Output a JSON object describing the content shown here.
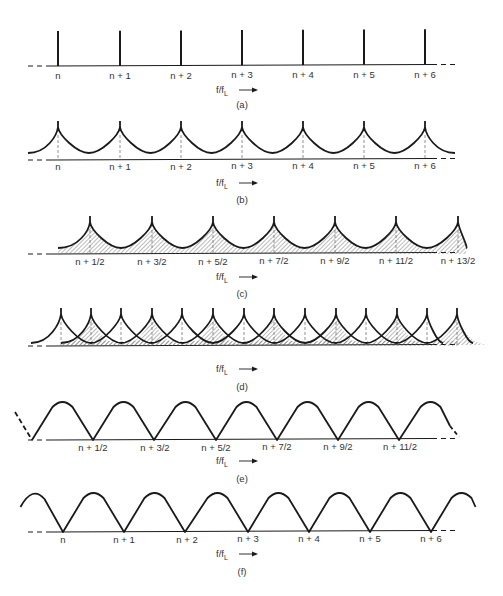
{
  "figure": {
    "colors": {
      "ink": "#1a1a1a",
      "text": "#333333",
      "background": "#ffffff",
      "hatch": "#555555"
    },
    "axis_label": {
      "main": "f/f",
      "subscript": "L"
    },
    "panels": [
      {
        "id": "a",
        "caption": "(a)",
        "type": "spikes",
        "baseline_y": 66,
        "peak_y": 31,
        "label_y": 79,
        "axis_label_y": 93,
        "caption_y": 108,
        "positions": [
          58,
          120,
          181,
          242,
          303,
          364,
          425
        ],
        "ticks": [
          {
            "x": 58,
            "label": "n"
          },
          {
            "x": 120,
            "label": "n + 1"
          },
          {
            "x": 181,
            "label": "n + 2"
          },
          {
            "x": 242,
            "label": "n + 3"
          },
          {
            "x": 303,
            "label": "n + 4"
          },
          {
            "x": 364,
            "label": "n + 5"
          },
          {
            "x": 425,
            "label": "n + 6"
          }
        ]
      },
      {
        "id": "b",
        "caption": "(b)",
        "type": "cusps",
        "baseline_y": 160,
        "peak_y": 121,
        "valley_y": 153,
        "label_y": 170,
        "axis_label_y": 186,
        "caption_y": 203,
        "positions": [
          58,
          120,
          181,
          242,
          303,
          364,
          425
        ],
        "ticks": [
          {
            "x": 58,
            "label": "n"
          },
          {
            "x": 120,
            "label": "n + 1"
          },
          {
            "x": 181,
            "label": "n + 2"
          },
          {
            "x": 242,
            "label": "n + 3"
          },
          {
            "x": 303,
            "label": "n + 4"
          },
          {
            "x": 364,
            "label": "n + 5"
          },
          {
            "x": 425,
            "label": "n + 6"
          }
        ]
      },
      {
        "id": "c",
        "caption": "(c)",
        "type": "hatched-cusps",
        "baseline_y": 254,
        "peak_y": 216,
        "valley_y": 248,
        "label_y": 265,
        "axis_label_y": 280,
        "caption_y": 297,
        "positions": [
          90,
          152,
          213,
          274,
          335,
          396,
          458
        ],
        "ticks": [
          {
            "x": 90,
            "label": "n + 1/2"
          },
          {
            "x": 152,
            "label": "n + 3/2"
          },
          {
            "x": 213,
            "label": "n + 5/2"
          },
          {
            "x": 274,
            "label": "n + 7/2"
          },
          {
            "x": 335,
            "label": "n + 9/2"
          },
          {
            "x": 396,
            "label": "n + 11/2"
          },
          {
            "x": 458,
            "label": "n + 13/2"
          }
        ]
      },
      {
        "id": "d",
        "caption": "(d)",
        "type": "overlapped-cusps",
        "baseline_y": 346,
        "peak_y": 308,
        "valley_y": 341,
        "axis_label_y": 372,
        "caption_y": 390,
        "positions": [
          61,
          91,
          121,
          152,
          182,
          213,
          244,
          274,
          305,
          336,
          366,
          397,
          427,
          457
        ],
        "ticks": []
      },
      {
        "id": "e",
        "caption": "(e)",
        "type": "arches",
        "baseline_y": 440,
        "peak_y": 402,
        "label_y": 451,
        "axis_label_y": 464,
        "caption_y": 482,
        "positions": [
          32,
          93,
          155,
          216,
          277,
          338,
          400
        ],
        "ticks": [
          {
            "x": 93,
            "label": "n + 1/2"
          },
          {
            "x": 155,
            "label": "n + 3/2"
          },
          {
            "x": 216,
            "label": "n + 5/2"
          },
          {
            "x": 277,
            "label": "n + 7/2"
          },
          {
            "x": 338,
            "label": "n + 9/2"
          },
          {
            "x": 400,
            "label": "n + 11/2"
          }
        ]
      },
      {
        "id": "f",
        "caption": "(f)",
        "type": "arches",
        "baseline_y": 532,
        "peak_y": 493,
        "label_y": 543,
        "axis_label_y": 557,
        "caption_y": 575,
        "positions": [
          63,
          124,
          187,
          248,
          309,
          370,
          431
        ],
        "ticks": [
          {
            "x": 63,
            "label": "n"
          },
          {
            "x": 124,
            "label": "n + 1"
          },
          {
            "x": 187,
            "label": "n + 2"
          },
          {
            "x": 248,
            "label": "n + 3"
          },
          {
            "x": 309,
            "label": "n + 4"
          },
          {
            "x": 370,
            "label": "n + 5"
          },
          {
            "x": 431,
            "label": "n + 6"
          }
        ]
      }
    ]
  }
}
